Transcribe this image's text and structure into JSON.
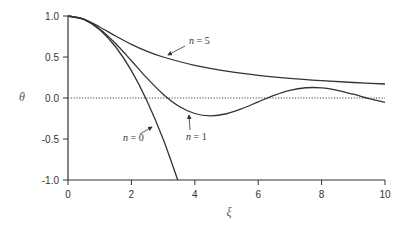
{
  "chart_data": {
    "type": "line",
    "title": "",
    "xlabel": "ξ",
    "ylabel": "θ",
    "xlim": [
      0,
      10
    ],
    "ylim": [
      -1.0,
      1.0
    ],
    "xticks": [
      0,
      2,
      4,
      6,
      8,
      10
    ],
    "xtick_labels": [
      "0",
      "2",
      "4",
      "6",
      "8",
      "10"
    ],
    "yticks": [
      1.0,
      0.5,
      0.0,
      -0.5,
      -1.0
    ],
    "ytick_labels": [
      "1.0",
      "0.5",
      "0.0",
      "-0.5",
      "-1.0"
    ],
    "grid": false,
    "reference_line": {
      "y": 0.0,
      "style": "dotted"
    },
    "series": [
      {
        "name": "n = 0",
        "x": [
          0,
          0.5,
          1,
          1.5,
          2,
          2.5,
          3,
          3.5
        ],
        "values": [
          1.0,
          0.958,
          0.833,
          0.625,
          0.333,
          -0.042,
          -0.5,
          -1.042
        ]
      },
      {
        "name": "n = 1",
        "x": [
          0,
          0.5,
          1,
          1.5,
          2,
          2.5,
          3,
          3.5,
          4,
          4.5,
          5,
          5.5,
          6,
          6.5,
          7,
          7.5,
          8,
          8.5,
          9,
          9.5,
          10
        ],
        "values": [
          1.0,
          0.959,
          0.841,
          0.665,
          0.455,
          0.239,
          0.047,
          -0.1,
          -0.189,
          -0.217,
          -0.192,
          -0.128,
          -0.047,
          0.033,
          0.094,
          0.125,
          0.124,
          0.094,
          0.046,
          -0.008,
          -0.054
        ]
      },
      {
        "name": "n = 5",
        "x": [
          0,
          0.5,
          1,
          1.5,
          2,
          2.5,
          3,
          4,
          5,
          6,
          7,
          8,
          9,
          10
        ],
        "values": [
          1.0,
          0.961,
          0.866,
          0.756,
          0.655,
          0.569,
          0.5,
          0.397,
          0.327,
          0.277,
          0.24,
          0.212,
          0.189,
          0.171
        ]
      }
    ],
    "annotations": [
      {
        "text": "n = 5",
        "series": "n = 5"
      },
      {
        "text": "n = 1",
        "series": "n = 1"
      },
      {
        "text": "n = 0",
        "series": "n = 0"
      }
    ]
  }
}
